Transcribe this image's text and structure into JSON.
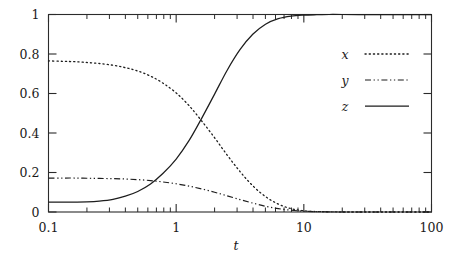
{
  "chart_data": {
    "type": "line",
    "title": "",
    "xlabel": "t",
    "ylabel": "",
    "xscale": "log",
    "yscale": "linear",
    "xlim": [
      0.1,
      100
    ],
    "ylim": [
      0,
      1
    ],
    "grid": false,
    "legend_position": "inside-right",
    "x_tick_labels": [
      "0.1",
      "1",
      "10",
      "100"
    ],
    "x_tick_values": [
      0.1,
      1,
      10,
      100
    ],
    "y_tick_labels": [
      "0",
      "0.2",
      "0.4",
      "0.6",
      "0.8",
      "1"
    ],
    "y_tick_values": [
      0,
      0.2,
      0.4,
      0.6,
      0.8,
      1
    ],
    "x": [
      0.1,
      0.13,
      0.16,
      0.2,
      0.25,
      0.32,
      0.4,
      0.5,
      0.63,
      0.79,
      1.0,
      1.26,
      1.58,
      2.0,
      2.51,
      3.16,
      3.98,
      5.01,
      6.31,
      7.94,
      10.0,
      12.6,
      15.8,
      20.0,
      31.6,
      50.0,
      100.0
    ],
    "series": [
      {
        "name": "x",
        "style": "dotted",
        "values": [
          0.765,
          0.763,
          0.761,
          0.757,
          0.752,
          0.743,
          0.731,
          0.714,
          0.688,
          0.652,
          0.603,
          0.539,
          0.462,
          0.376,
          0.288,
          0.205,
          0.133,
          0.078,
          0.04,
          0.017,
          0.006,
          0.002,
          0.001,
          0.0,
          0.0,
          0.0,
          0.0
        ]
      },
      {
        "name": "y",
        "style": "dash-dot",
        "values": [
          0.172,
          0.172,
          0.172,
          0.171,
          0.17,
          0.169,
          0.167,
          0.164,
          0.159,
          0.152,
          0.143,
          0.131,
          0.117,
          0.1,
          0.082,
          0.063,
          0.045,
          0.029,
          0.017,
          0.009,
          0.004,
          0.002,
          0.001,
          0.0,
          0.0,
          0.0,
          0.0
        ]
      },
      {
        "name": "z",
        "style": "solid",
        "values": [
          0.05,
          0.05,
          0.05,
          0.051,
          0.055,
          0.064,
          0.08,
          0.104,
          0.142,
          0.196,
          0.268,
          0.361,
          0.473,
          0.597,
          0.718,
          0.822,
          0.9,
          0.951,
          0.979,
          0.992,
          0.997,
          0.999,
          1.0,
          1.0,
          1.0,
          1.0,
          1.0
        ]
      }
    ],
    "legend": [
      {
        "label": "x",
        "style": "dotted"
      },
      {
        "label": "y",
        "style": "dash-dot"
      },
      {
        "label": "z",
        "style": "solid"
      }
    ],
    "colors": {
      "axis": "#2b2b2b",
      "curve": "#1d1d1d",
      "background": "#ffffff"
    }
  }
}
